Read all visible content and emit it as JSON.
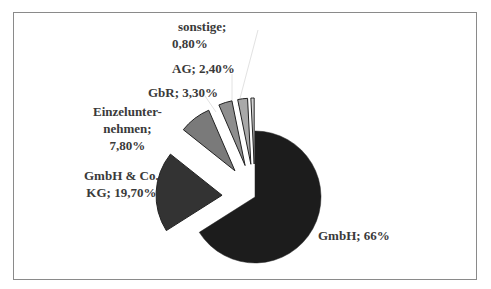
{
  "chart_data": {
    "type": "pie",
    "title": "",
    "exploded": true,
    "start_angle_deg": 0,
    "direction": "clockwise",
    "categories": [
      "GmbH",
      "GmbH & Co. KG",
      "Einzelunternehmen",
      "GbR",
      "AG",
      "sonstige"
    ],
    "values": [
      66.0,
      19.7,
      7.8,
      3.3,
      2.4,
      0.8
    ],
    "series": [
      {
        "name": "GmbH",
        "value": 66.0,
        "label": "GmbH; 66%",
        "color": "#1c1c1c",
        "explode": 0
      },
      {
        "name": "GmbH & Co. KG",
        "value": 19.7,
        "label": "GmbH & Co. KG; 19,70%",
        "color": "#333333",
        "explode": 33
      },
      {
        "name": "Einzelunternehmen",
        "value": 7.8,
        "label": "Einzelunternehmen; 7,80%",
        "color": "#7a7a7a",
        "explode": 33
      },
      {
        "name": "GbR",
        "value": 3.3,
        "label": "GbR; 3,30%",
        "color": "#8e8e8e",
        "explode": 33
      },
      {
        "name": "AG",
        "value": 2.4,
        "label": "AG; 2,40%",
        "color": "#a9a9a9",
        "explode": 33
      },
      {
        "name": "sonstige",
        "value": 0.8,
        "label": "sonstige; 0,80%",
        "color": "#d4d4d4",
        "explode": 33
      }
    ],
    "legend": "none",
    "data_labels": "category; percent"
  },
  "labels": {
    "gmbh": {
      "line1": "GmbH; 66%"
    },
    "kg": {
      "line1": "GmbH & Co.",
      "line2": "KG; 19,70%"
    },
    "einzel": {
      "line1": "Einzelunter-",
      "line2": "nehmen;",
      "line3": "7,80%"
    },
    "gbr": {
      "line1": "GbR; 3,30%"
    },
    "ag": {
      "line1": "AG; 2,40%"
    },
    "sonstige": {
      "line1": "sonstige;",
      "line2": "0,80%"
    }
  },
  "geometry": {
    "cx": 255,
    "cy": 197,
    "r": 66
  }
}
